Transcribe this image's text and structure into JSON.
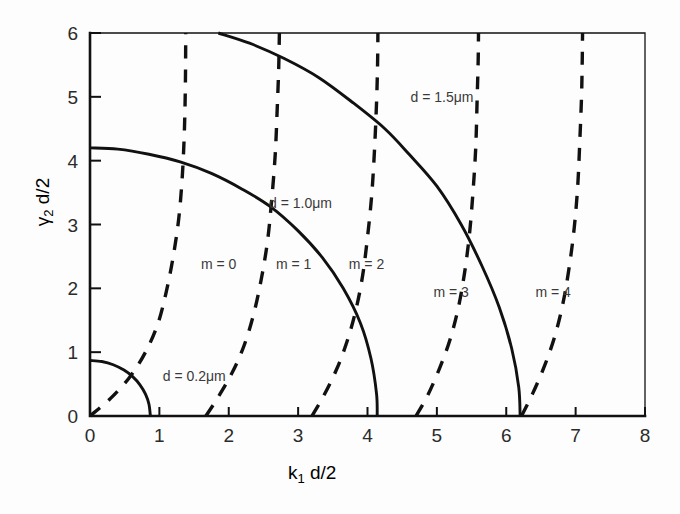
{
  "chart_data": {
    "type": "line",
    "title": "",
    "xlabel": "k₁ d/2",
    "ylabel": "γ₂ d/2",
    "xlim": [
      0,
      8
    ],
    "ylim": [
      0,
      6
    ],
    "xticks": [
      "0",
      "1",
      "2",
      "3",
      "4",
      "5",
      "6",
      "7",
      "8"
    ],
    "yticks": [
      "0",
      "1",
      "2",
      "3",
      "4",
      "5",
      "6"
    ],
    "grid": false,
    "legend": "none (inline curve annotations)",
    "series": [
      {
        "name": "d = 0.2μm",
        "style": "solid",
        "kind": "quarter-circle",
        "radius": 0.87,
        "label": "d = 0.2μm",
        "label_x": 1.05,
        "label_y": 0.62,
        "points": [
          [
            0.0,
            0.87
          ],
          [
            0.17,
            0.853
          ],
          [
            0.335,
            0.803
          ],
          [
            0.49,
            0.719
          ],
          [
            0.615,
            0.616
          ],
          [
            0.72,
            0.489
          ],
          [
            0.8,
            0.343
          ],
          [
            0.85,
            0.185
          ],
          [
            0.87,
            0.0
          ]
        ]
      },
      {
        "name": "d = 1.0μm",
        "style": "solid",
        "kind": "quarter-circle",
        "radius": 4.14,
        "label": "d = 1.0μm",
        "label_x": 2.58,
        "label_y": 3.33,
        "points": [
          [
            0.0,
            4.2
          ],
          [
            0.4,
            4.18
          ],
          [
            0.85,
            4.1
          ],
          [
            1.3,
            3.98
          ],
          [
            1.75,
            3.8
          ],
          [
            2.2,
            3.55
          ],
          [
            2.6,
            3.28
          ],
          [
            3.0,
            2.9
          ],
          [
            3.35,
            2.48
          ],
          [
            3.65,
            2.0
          ],
          [
            3.9,
            1.45
          ],
          [
            4.05,
            0.9
          ],
          [
            4.13,
            0.35
          ],
          [
            4.14,
            0.0
          ]
        ]
      },
      {
        "name": "d = 1.5μm",
        "style": "solid",
        "kind": "quarter-circle",
        "radius": 6.2,
        "label": "d = 1.5μm",
        "label_x": 4.62,
        "label_y": 5.0,
        "points": [
          [
            1.85,
            6.0
          ],
          [
            2.3,
            5.84
          ],
          [
            2.8,
            5.6
          ],
          [
            3.3,
            5.3
          ],
          [
            3.8,
            4.9
          ],
          [
            4.25,
            4.5
          ],
          [
            4.6,
            4.1
          ],
          [
            5.0,
            3.6
          ],
          [
            5.35,
            3.0
          ],
          [
            5.65,
            2.35
          ],
          [
            5.9,
            1.7
          ],
          [
            6.08,
            1.05
          ],
          [
            6.18,
            0.45
          ],
          [
            6.2,
            0.0
          ]
        ]
      },
      {
        "name": "m = 0",
        "style": "dashed",
        "kind": "mode",
        "label": "m = 0",
        "label_x": 1.6,
        "label_y": 2.38,
        "points": [
          [
            0.0,
            0.0
          ],
          [
            0.3,
            0.28
          ],
          [
            0.58,
            0.62
          ],
          [
            0.8,
            1.0
          ],
          [
            0.98,
            1.45
          ],
          [
            1.1,
            1.95
          ],
          [
            1.2,
            2.5
          ],
          [
            1.28,
            3.1
          ],
          [
            1.33,
            3.75
          ],
          [
            1.36,
            4.45
          ],
          [
            1.375,
            5.2
          ],
          [
            1.38,
            6.0
          ]
        ]
      },
      {
        "name": "m = 1",
        "style": "dashed",
        "kind": "mode",
        "label": "m = 1",
        "label_x": 2.68,
        "label_y": 2.38,
        "points": [
          [
            1.67,
            0.0
          ],
          [
            1.85,
            0.3
          ],
          [
            2.05,
            0.68
          ],
          [
            2.22,
            1.1
          ],
          [
            2.36,
            1.6
          ],
          [
            2.47,
            2.15
          ],
          [
            2.56,
            2.75
          ],
          [
            2.62,
            3.4
          ],
          [
            2.67,
            4.1
          ],
          [
            2.7,
            4.85
          ],
          [
            2.72,
            5.45
          ],
          [
            2.73,
            6.0
          ]
        ]
      },
      {
        "name": "m = 2",
        "style": "dashed",
        "kind": "mode",
        "label": "m = 2",
        "label_x": 3.73,
        "label_y": 2.38,
        "points": [
          [
            3.2,
            0.0
          ],
          [
            3.37,
            0.32
          ],
          [
            3.55,
            0.72
          ],
          [
            3.7,
            1.15
          ],
          [
            3.83,
            1.65
          ],
          [
            3.93,
            2.2
          ],
          [
            4.0,
            2.8
          ],
          [
            4.06,
            3.45
          ],
          [
            4.1,
            4.15
          ],
          [
            4.13,
            4.9
          ],
          [
            4.145,
            5.5
          ],
          [
            4.15,
            6.0
          ]
        ]
      },
      {
        "name": "m = 3",
        "style": "dashed",
        "kind": "mode",
        "label": "m = 3",
        "label_x": 4.95,
        "label_y": 1.95,
        "points": [
          [
            4.7,
            0.0
          ],
          [
            4.87,
            0.33
          ],
          [
            5.04,
            0.75
          ],
          [
            5.19,
            1.2
          ],
          [
            5.31,
            1.7
          ],
          [
            5.4,
            2.25
          ],
          [
            5.47,
            2.85
          ],
          [
            5.52,
            3.5
          ],
          [
            5.56,
            4.2
          ],
          [
            5.58,
            4.95
          ],
          [
            5.595,
            5.55
          ],
          [
            5.6,
            6.0
          ]
        ]
      },
      {
        "name": "m = 4",
        "style": "dashed",
        "kind": "mode",
        "label": "m = 4",
        "label_x": 6.42,
        "label_y": 1.95,
        "points": [
          [
            6.22,
            0.0
          ],
          [
            6.38,
            0.35
          ],
          [
            6.55,
            0.78
          ],
          [
            6.7,
            1.25
          ],
          [
            6.82,
            1.78
          ],
          [
            6.91,
            2.35
          ],
          [
            6.98,
            2.95
          ],
          [
            7.03,
            3.6
          ],
          [
            7.06,
            4.3
          ],
          [
            7.085,
            5.0
          ],
          [
            7.095,
            5.55
          ],
          [
            7.1,
            6.0
          ]
        ]
      }
    ]
  },
  "axes": {
    "x_label_main": "k",
    "x_label_sub": "1",
    "x_label_rest": " d/2",
    "y_label_main": "γ",
    "y_label_sub": "2",
    "y_label_rest": " d/2"
  },
  "colors": {
    "ink": "#111111",
    "background": "#fdfdfd",
    "text": "#2b2b2b"
  }
}
